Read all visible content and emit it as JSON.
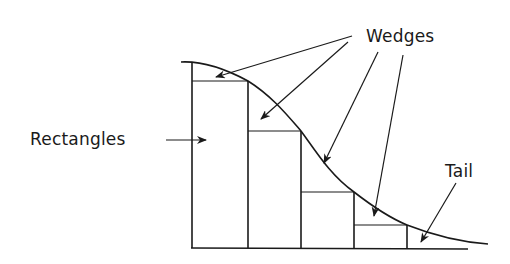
{
  "diagram": {
    "type": "riemann-sum-illustration",
    "labels": {
      "rectangles": "Rectangles",
      "wedges": "Wedges",
      "tail": "Tail"
    },
    "colors": {
      "ink": "#1a1a1a",
      "background": "#ffffff"
    },
    "axes": {
      "baseline_y": 248,
      "left_x": 192,
      "baseline_end_x": 468
    },
    "rectangles": [
      {
        "x": 192,
        "top": 81,
        "right": 248
      },
      {
        "x": 248,
        "top": 131,
        "right": 301
      },
      {
        "x": 301,
        "top": 192,
        "right": 354
      },
      {
        "x": 354,
        "top": 225,
        "right": 407
      }
    ],
    "curve_description": "decreasing bell-shaped curve from peak at left to tail at right"
  }
}
